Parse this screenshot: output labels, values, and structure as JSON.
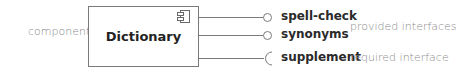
{
  "diagram": {
    "type": "UML component diagram",
    "component": {
      "annotation": "component",
      "name": "Dictionary",
      "icon": "component-icon"
    },
    "interfaces": [
      {
        "name": "spell-check",
        "kind": "provided",
        "symbol": "lollipop"
      },
      {
        "name": "synonyms",
        "kind": "provided",
        "symbol": "lollipop"
      },
      {
        "name": "supplement",
        "kind": "required",
        "symbol": "socket"
      }
    ],
    "annotations": {
      "provided": "provided interfaces",
      "required": "required interface"
    },
    "colors": {
      "line": "#7a7a7a",
      "bold_text": "#2a2a2a",
      "annotation_text": "#8a8a8a"
    }
  }
}
